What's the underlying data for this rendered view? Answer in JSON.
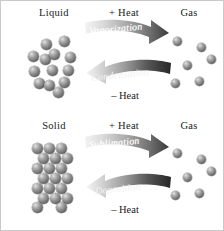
{
  "figure": {
    "background": "#ffffff",
    "border_color": "#c9c9c9",
    "sphere_color": "#8a8a8a",
    "arrow_dark": "#2b2b2b",
    "arrow_light": "#eeeeee",
    "text_color": "#1a1a1a"
  },
  "panels": [
    {
      "id": "liquid-gas",
      "left_label": "Liquid",
      "right_label": "Gas",
      "top_heat_label": "+ Heat",
      "bottom_heat_label": "– Heat",
      "forward_process": "Vaporization",
      "reverse_process": "Condensation",
      "left_molecule_count": 13,
      "right_molecule_count": 6
    },
    {
      "id": "solid-gas",
      "left_label": "Solid",
      "right_label": "Gas",
      "top_heat_label": "+ Heat",
      "bottom_heat_label": "– Heat",
      "forward_process": "Sublimation",
      "reverse_process": "Deposition",
      "left_molecule_count": 20,
      "right_molecule_count": 6
    }
  ],
  "molecules": {
    "liquid": [
      {
        "x": 16,
        "y": 14,
        "r": 5.6
      },
      {
        "x": 34,
        "y": 11,
        "r": 5.6
      },
      {
        "x": 3,
        "y": 26,
        "r": 5.6
      },
      {
        "x": 15,
        "y": 29,
        "r": 5.6
      },
      {
        "x": 24,
        "y": 24,
        "r": 5.6
      },
      {
        "x": 40,
        "y": 27,
        "r": 5.6
      },
      {
        "x": 4,
        "y": 41,
        "r": 5.6
      },
      {
        "x": 22,
        "y": 40,
        "r": 5.6
      },
      {
        "x": 38,
        "y": 40,
        "r": 5.6
      },
      {
        "x": 9,
        "y": 53,
        "r": 5.6
      },
      {
        "x": 19,
        "y": 55,
        "r": 5.6
      },
      {
        "x": 34,
        "y": 52,
        "r": 5.6
      },
      {
        "x": 28,
        "y": 62,
        "r": 5.6
      }
    ],
    "solid": [
      {
        "x": 3,
        "y": 4,
        "r": 5.6
      },
      {
        "x": 15,
        "y": 4,
        "r": 5.6
      },
      {
        "x": 27,
        "y": 4,
        "r": 5.6
      },
      {
        "x": 9,
        "y": 14,
        "r": 5.6
      },
      {
        "x": 21,
        "y": 14,
        "r": 5.6
      },
      {
        "x": 33,
        "y": 14,
        "r": 5.6
      },
      {
        "x": 3,
        "y": 24,
        "r": 5.6
      },
      {
        "x": 15,
        "y": 24,
        "r": 5.6
      },
      {
        "x": 27,
        "y": 24,
        "r": 5.6
      },
      {
        "x": 9,
        "y": 34,
        "r": 5.6
      },
      {
        "x": 21,
        "y": 34,
        "r": 5.6
      },
      {
        "x": 33,
        "y": 34,
        "r": 5.6
      },
      {
        "x": 3,
        "y": 44,
        "r": 5.6
      },
      {
        "x": 15,
        "y": 44,
        "r": 5.6
      },
      {
        "x": 27,
        "y": 44,
        "r": 5.6
      },
      {
        "x": 9,
        "y": 54,
        "r": 5.6
      },
      {
        "x": 21,
        "y": 54,
        "r": 5.6
      },
      {
        "x": 33,
        "y": 54,
        "r": 5.6
      },
      {
        "x": 3,
        "y": 63,
        "r": 5.6
      },
      {
        "x": 27,
        "y": 63,
        "r": 5.6
      }
    ],
    "gas_top": [
      {
        "x": 6,
        "y": 8,
        "r": 4.6
      },
      {
        "x": 30,
        "y": 14,
        "r": 4.6
      },
      {
        "x": 16,
        "y": 32,
        "r": 4.6
      },
      {
        "x": 4,
        "y": 50,
        "r": 4.6
      },
      {
        "x": 28,
        "y": 48,
        "r": 4.6
      },
      {
        "x": 40,
        "y": 26,
        "r": 4.6
      }
    ],
    "gas_bottom": [
      {
        "x": 6,
        "y": 8,
        "r": 4.6
      },
      {
        "x": 30,
        "y": 14,
        "r": 4.6
      },
      {
        "x": 16,
        "y": 32,
        "r": 4.6
      },
      {
        "x": 4,
        "y": 50,
        "r": 4.6
      },
      {
        "x": 28,
        "y": 48,
        "r": 4.6
      },
      {
        "x": 40,
        "y": 26,
        "r": 4.6
      }
    ]
  }
}
